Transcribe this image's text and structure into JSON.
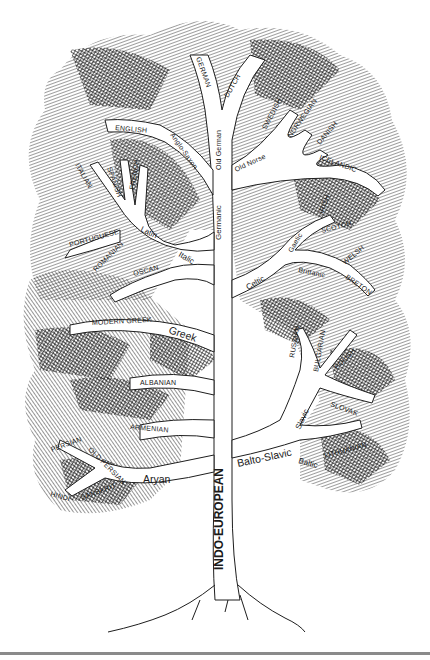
{
  "colors": {
    "ink": "#1a1a1a",
    "paper": "#ffffff",
    "rule": "#8a8a8a"
  },
  "root": "INDO-EUROPEAN",
  "branches": {
    "germanic": {
      "label": "Germanic",
      "sub": {
        "old_german": "Old German",
        "anglo_saxon": "Anglo-Saxon",
        "old_norse": "Old Norse"
      },
      "languages": {
        "german": "GERMAN",
        "dutch": "DUTCH",
        "english": "ENGLISH",
        "swedish": "SWEDISH",
        "norwegian": "NORWEGIAN",
        "danish": "DANISH",
        "icelandic": "ICELANDIC"
      }
    },
    "italic": {
      "label": "Italic",
      "sub": {
        "latin": "Latin"
      },
      "languages": {
        "italian": "ITALIAN",
        "spanish": "SPANISH",
        "french": "FRENCH",
        "portuguese": "PORTUGUESE",
        "romanian": "ROMANIAN",
        "oscan": "OSCAN"
      }
    },
    "celtic": {
      "label": "Celtic",
      "sub": {
        "gaelic": "Gaelic",
        "brittanic": "Brittanic"
      },
      "languages": {
        "irish": "IRISH",
        "scotch": "SCOTCH",
        "welsh": "WELSH",
        "breton": "BRETON"
      }
    },
    "greek": {
      "label": "Greek",
      "languages": {
        "modern_greek": "MODERN GREEK"
      }
    },
    "albanian": {
      "languages": {
        "albanian": "ALBANIAN"
      }
    },
    "armenian": {
      "languages": {
        "armenian": "ARMENIAN"
      }
    },
    "balto_slavic": {
      "label": "Balto-Slavic",
      "sub": {
        "slavic": "Slavic",
        "baltic": "Baltic"
      },
      "languages": {
        "russian": "RUSSIAN",
        "bulgarian": "BULGARIAN",
        "polish": "POLISH",
        "slovak": "SLOVAK",
        "lithuanian": "LITHUANIAN"
      }
    },
    "aryan": {
      "label": "Aryan",
      "languages": {
        "persian": "PERSIAN",
        "old_persian": "OLD PERSIAN",
        "hindi": "HINDI",
        "sanskrit": "SANSKRIT"
      }
    }
  }
}
